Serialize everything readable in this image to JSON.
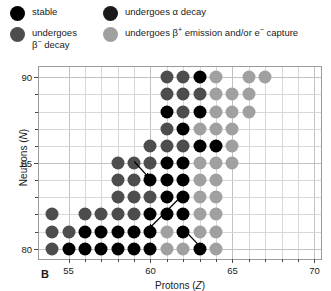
{
  "legend": {
    "items": [
      {
        "id": "stable",
        "label": "stable",
        "color": "#000000"
      },
      {
        "id": "beta-minus",
        "label": "undergoes β⁻ decay",
        "color": "#4d4d4d"
      },
      {
        "id": "alpha",
        "label": "undergoes α decay",
        "color": "#1a1a1a"
      },
      {
        "id": "beta-plus-ec",
        "label": "undergoes β⁺ emission and/or e⁻ capture",
        "color": "#a0a0a0"
      }
    ]
  },
  "panel_label": "B",
  "chart_data": {
    "type": "scatter",
    "title": "",
    "xlabel": "Protons (Z)",
    "ylabel": "Neutrons (N)",
    "xlim": [
      53.2,
      70.4
    ],
    "ylim": [
      79.4,
      90.6
    ],
    "xticks": [
      55,
      60,
      65,
      70
    ],
    "xticks_minor": [
      56,
      57,
      58,
      59,
      61,
      62,
      63,
      64,
      66,
      67,
      68,
      69
    ],
    "yticks": [
      80,
      85,
      90
    ],
    "yticks_minor": [
      81,
      82,
      83,
      84,
      86,
      87,
      88,
      89
    ],
    "grid": true,
    "legend_position": "above-plot",
    "categories": [
      "stable",
      "beta-minus",
      "alpha",
      "beta-plus-ec"
    ],
    "colors": {
      "stable": "#000000",
      "beta-minus": "#4d4d4d",
      "alpha": "#1a1a1a",
      "beta-plus-ec": "#a0a0a0"
    },
    "annotations": [
      {
        "type": "arrow",
        "label": "beta-minus-transition",
        "x1": 59.05,
        "y1": 85.05,
        "x2": 59.95,
        "y2": 84.1
      },
      {
        "type": "arrow",
        "label": "alpha-transition",
        "x1": 62.1,
        "y1": 83.15,
        "x2": 59.95,
        "y2": 81.1
      },
      {
        "type": "arrow",
        "label": "beta-plus-transition",
        "x1": 63.1,
        "y1": 80.05,
        "x2": 62.1,
        "y2": 81.05
      }
    ],
    "points": [
      {
        "Z": 54,
        "N": 82,
        "type": "beta-minus"
      },
      {
        "Z": 54,
        "N": 80,
        "type": "beta-minus"
      },
      {
        "Z": 54,
        "N": 81,
        "type": "beta-minus"
      },
      {
        "Z": 55,
        "N": 81,
        "type": "beta-minus"
      },
      {
        "Z": 55,
        "N": 80,
        "type": "stable"
      },
      {
        "Z": 56,
        "N": 82,
        "type": "beta-minus"
      },
      {
        "Z": 56,
        "N": 81,
        "type": "stable"
      },
      {
        "Z": 56,
        "N": 80,
        "type": "stable"
      },
      {
        "Z": 57,
        "N": 82,
        "type": "beta-minus"
      },
      {
        "Z": 57,
        "N": 81,
        "type": "stable"
      },
      {
        "Z": 57,
        "N": 80,
        "type": "stable"
      },
      {
        "Z": 58,
        "N": 85,
        "type": "beta-minus"
      },
      {
        "Z": 58,
        "N": 84,
        "type": "beta-minus"
      },
      {
        "Z": 58,
        "N": 83,
        "type": "beta-minus"
      },
      {
        "Z": 58,
        "N": 82,
        "type": "beta-minus"
      },
      {
        "Z": 58,
        "N": 81,
        "type": "stable"
      },
      {
        "Z": 58,
        "N": 80,
        "type": "stable"
      },
      {
        "Z": 59,
        "N": 85,
        "type": "beta-minus"
      },
      {
        "Z": 59,
        "N": 84,
        "type": "beta-minus"
      },
      {
        "Z": 59,
        "N": 83,
        "type": "beta-minus"
      },
      {
        "Z": 59,
        "N": 82,
        "type": "beta-minus"
      },
      {
        "Z": 59,
        "N": 81,
        "type": "stable"
      },
      {
        "Z": 59,
        "N": 80,
        "type": "stable"
      },
      {
        "Z": 60,
        "N": 86,
        "type": "beta-minus"
      },
      {
        "Z": 60,
        "N": 85,
        "type": "beta-minus"
      },
      {
        "Z": 60,
        "N": 84,
        "type": "stable"
      },
      {
        "Z": 60,
        "N": 83,
        "type": "beta-minus"
      },
      {
        "Z": 60,
        "N": 82,
        "type": "stable"
      },
      {
        "Z": 60,
        "N": 81,
        "type": "stable"
      },
      {
        "Z": 60,
        "N": 80,
        "type": "stable"
      },
      {
        "Z": 61,
        "N": 90,
        "type": "beta-minus"
      },
      {
        "Z": 61,
        "N": 89,
        "type": "beta-minus"
      },
      {
        "Z": 61,
        "N": 88,
        "type": "stable"
      },
      {
        "Z": 61,
        "N": 87,
        "type": "beta-minus"
      },
      {
        "Z": 61,
        "N": 86,
        "type": "beta-minus"
      },
      {
        "Z": 61,
        "N": 85,
        "type": "stable"
      },
      {
        "Z": 61,
        "N": 84,
        "type": "stable"
      },
      {
        "Z": 61,
        "N": 83,
        "type": "stable"
      },
      {
        "Z": 61,
        "N": 82,
        "type": "stable"
      },
      {
        "Z": 61,
        "N": 81,
        "type": "beta-plus-ec"
      },
      {
        "Z": 61,
        "N": 80,
        "type": "beta-plus-ec"
      },
      {
        "Z": 62,
        "N": 90,
        "type": "beta-minus"
      },
      {
        "Z": 62,
        "N": 89,
        "type": "beta-minus"
      },
      {
        "Z": 62,
        "N": 88,
        "type": "beta-minus"
      },
      {
        "Z": 62,
        "N": 87,
        "type": "stable"
      },
      {
        "Z": 62,
        "N": 86,
        "type": "beta-minus"
      },
      {
        "Z": 62,
        "N": 85,
        "type": "stable"
      },
      {
        "Z": 62,
        "N": 84,
        "type": "stable"
      },
      {
        "Z": 62,
        "N": 83,
        "type": "stable"
      },
      {
        "Z": 62,
        "N": 82,
        "type": "stable"
      },
      {
        "Z": 62,
        "N": 81,
        "type": "stable"
      },
      {
        "Z": 62,
        "N": 80,
        "type": "beta-plus-ec"
      },
      {
        "Z": 63,
        "N": 90,
        "type": "stable"
      },
      {
        "Z": 63,
        "N": 89,
        "type": "beta-minus"
      },
      {
        "Z": 63,
        "N": 88,
        "type": "stable"
      },
      {
        "Z": 63,
        "N": 87,
        "type": "beta-plus-ec"
      },
      {
        "Z": 63,
        "N": 86,
        "type": "stable"
      },
      {
        "Z": 63,
        "N": 85,
        "type": "beta-plus-ec"
      },
      {
        "Z": 63,
        "N": 84,
        "type": "beta-plus-ec"
      },
      {
        "Z": 63,
        "N": 83,
        "type": "beta-plus-ec"
      },
      {
        "Z": 63,
        "N": 82,
        "type": "beta-plus-ec"
      },
      {
        "Z": 63,
        "N": 81,
        "type": "beta-plus-ec"
      },
      {
        "Z": 63,
        "N": 80,
        "type": "stable"
      },
      {
        "Z": 64,
        "N": 90,
        "type": "beta-plus-ec"
      },
      {
        "Z": 64,
        "N": 89,
        "type": "beta-plus-ec"
      },
      {
        "Z": 64,
        "N": 88,
        "type": "beta-plus-ec"
      },
      {
        "Z": 64,
        "N": 87,
        "type": "beta-plus-ec"
      },
      {
        "Z": 64,
        "N": 86,
        "type": "stable"
      },
      {
        "Z": 64,
        "N": 85,
        "type": "beta-plus-ec"
      },
      {
        "Z": 64,
        "N": 84,
        "type": "beta-plus-ec"
      },
      {
        "Z": 64,
        "N": 83,
        "type": "beta-plus-ec"
      },
      {
        "Z": 64,
        "N": 82,
        "type": "beta-plus-ec"
      },
      {
        "Z": 64,
        "N": 81,
        "type": "beta-plus-ec"
      },
      {
        "Z": 64,
        "N": 80,
        "type": "beta-plus-ec"
      },
      {
        "Z": 65,
        "N": 89,
        "type": "beta-plus-ec"
      },
      {
        "Z": 65,
        "N": 88,
        "type": "beta-plus-ec"
      },
      {
        "Z": 65,
        "N": 87,
        "type": "beta-plus-ec"
      },
      {
        "Z": 65,
        "N": 86,
        "type": "beta-plus-ec"
      },
      {
        "Z": 65,
        "N": 85,
        "type": "beta-plus-ec"
      },
      {
        "Z": 66,
        "N": 90,
        "type": "beta-plus-ec"
      },
      {
        "Z": 66,
        "N": 89,
        "type": "beta-plus-ec"
      },
      {
        "Z": 66,
        "N": 88,
        "type": "beta-plus-ec"
      },
      {
        "Z": 67,
        "N": 90,
        "type": "beta-plus-ec"
      }
    ]
  }
}
